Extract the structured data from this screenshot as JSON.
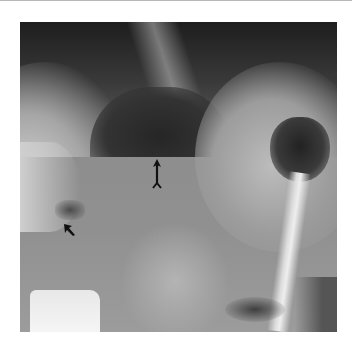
{
  "image": {
    "kind": "radiograph",
    "description": "Grayscale X-ray with air-fluid level and contrast column",
    "annotations": [
      {
        "type": "arrow",
        "direction": "up",
        "label": "",
        "color": "#111111"
      },
      {
        "type": "arrow",
        "direction": "up-left",
        "label": "",
        "color": "#111111"
      }
    ]
  },
  "colors": {
    "background": "#ffffff",
    "top_rule": "#b8b8b8"
  }
}
